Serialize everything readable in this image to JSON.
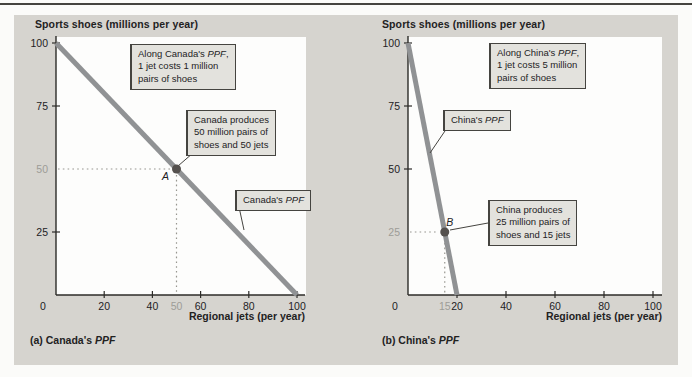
{
  "page": {
    "bg": "#fbfbf9",
    "rule_color": "#45443f"
  },
  "figure_panel": {
    "bg": "#d6d4cf"
  },
  "colors": {
    "plot_bg": "#fdfdfc",
    "axis": "#2c2b28",
    "text": "#23221f",
    "muted_label": "#9d9c97",
    "ppf_line": "#909294",
    "point_dot": "#55514e",
    "guide_dotted": "#97968f",
    "callout_bg": "#e3e2dd",
    "callout_border": "#454440"
  },
  "chart_data": [
    {
      "id": "canada",
      "type": "line",
      "title": "Sports shoes (millions per year)",
      "xlabel": "Regional jets (per year)",
      "caption": "(a) Canada's PPF",
      "xlim": [
        0,
        100
      ],
      "ylim": [
        0,
        100
      ],
      "grid": false,
      "x_zero_label": "0",
      "xticks": [
        20,
        40,
        60,
        80,
        100
      ],
      "muted_xticks": [
        50
      ],
      "yticks": [
        25,
        75,
        100
      ],
      "muted_yticks": [
        50
      ],
      "series": [
        {
          "name": "Canada's PPF",
          "x": [
            0,
            100
          ],
          "y": [
            100,
            0
          ]
        }
      ],
      "points": [
        {
          "label": "A",
          "x": 50,
          "y": 50,
          "label_offset": [
            -11,
            11
          ]
        }
      ],
      "annotations": [
        {
          "name": "opportunity-cost-note",
          "lines": [
            "Along Canada's PPF,",
            "1 jet costs 1 million",
            "pairs of shoes"
          ],
          "box": [
            116,
            29
          ],
          "leader": null
        },
        {
          "name": "production-note",
          "lines": [
            "Canada produces",
            "50 million pairs of",
            "shoes and 50 jets"
          ],
          "box": [
            172,
            95
          ],
          "leader": [
            179,
            138,
            164,
            151
          ]
        },
        {
          "name": "ppf-line-label",
          "lines": [
            "Canada's PPF"
          ],
          "box": [
            221,
            175
          ],
          "leader": [
            225,
            192,
            230,
            215
          ]
        }
      ],
      "layout": {
        "origin": [
          42,
          280
        ],
        "x_unit": 2.41,
        "y_unit": 2.52,
        "x_axis_end": 291,
        "y_axis_top": 21,
        "plot": [
          42,
          22,
          250,
          258
        ],
        "title_left": 21,
        "caption_left": 16,
        "xlabel_right": 291
      }
    },
    {
      "id": "china",
      "type": "line",
      "title": "Sports shoes (millions per year)",
      "xlabel": "Regional jets (per year)",
      "caption": "(b) China's PPF",
      "xlim": [
        0,
        100
      ],
      "ylim": [
        0,
        100
      ],
      "grid": false,
      "x_zero_label": "0",
      "xticks": [
        20,
        40,
        60,
        80,
        100
      ],
      "muted_xticks": [
        15
      ],
      "yticks": [
        50,
        75,
        100
      ],
      "muted_yticks": [
        25
      ],
      "series": [
        {
          "name": "China's PPF",
          "x": [
            0,
            20
          ],
          "y": [
            100,
            0
          ]
        }
      ],
      "points": [
        {
          "label": "B",
          "x": 15,
          "y": 25,
          "label_offset": [
            5,
            -6
          ]
        }
      ],
      "annotations": [
        {
          "name": "opportunity-cost-note",
          "lines": [
            "Along China's PPF,",
            "1 jet costs 5 million",
            "pairs of shoes"
          ],
          "box": [
            143,
            28
          ],
          "leader": null
        },
        {
          "name": "ppf-line-label",
          "lines": [
            "China's PPF"
          ],
          "box": [
            97,
            95
          ],
          "leader": [
            101,
            113,
            84,
            138
          ]
        },
        {
          "name": "production-note",
          "lines": [
            "China produces",
            "25 million pairs of",
            "shoes and 15 jets"
          ],
          "box": [
            142,
            185
          ],
          "leader": [
            142,
            208,
            104,
            215
          ]
        }
      ],
      "layout": {
        "origin": [
          62,
          280
        ],
        "x_unit": 2.45,
        "y_unit": 2.52,
        "x_axis_end": 316,
        "y_axis_top": 21,
        "plot": [
          62,
          22,
          254,
          258
        ],
        "title_left": 36,
        "caption_left": 36,
        "xlabel_right": 316
      }
    }
  ]
}
